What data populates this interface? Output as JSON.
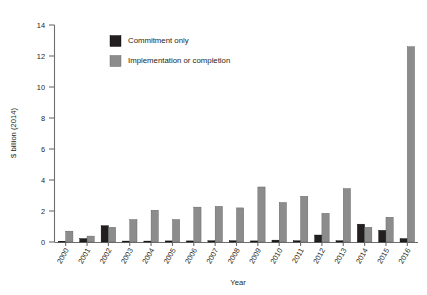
{
  "chart_data": {
    "type": "bar",
    "title": "",
    "subtitle": "",
    "xlabel": "Year",
    "ylabel": "$ billion (2014)",
    "categories": [
      "2000",
      "2001",
      "2002",
      "2003",
      "2004",
      "2005",
      "2006",
      "2007",
      "2008",
      "2009",
      "2010",
      "2011",
      "2012",
      "2013",
      "2014",
      "2015",
      "2016"
    ],
    "series": [
      {
        "name": "Commitment only",
        "color": "#231f20",
        "values": [
          0.05,
          0.22,
          1.05,
          0.06,
          0.06,
          0.07,
          0.07,
          0.08,
          0.08,
          0.07,
          0.12,
          0.08,
          0.45,
          0.08,
          1.15,
          0.75,
          0.22
        ]
      },
      {
        "name": "Implementation or completion",
        "color": "#8c8c8c",
        "values": [
          0.7,
          0.38,
          0.95,
          1.45,
          2.05,
          1.45,
          2.25,
          2.3,
          2.2,
          3.55,
          2.55,
          2.95,
          1.85,
          3.45,
          0.95,
          1.6,
          12.6
        ]
      }
    ],
    "ylim": [
      0,
      14
    ],
    "yticks": [
      0,
      2,
      4,
      6,
      8,
      10,
      12,
      14
    ],
    "grid": false,
    "legend_position": "top-center",
    "legend": [
      {
        "label": "Commitment only",
        "swatch_color": "#231f20"
      },
      {
        "label": "Implementation or completion",
        "swatch_color": "#8c8c8c"
      }
    ]
  }
}
